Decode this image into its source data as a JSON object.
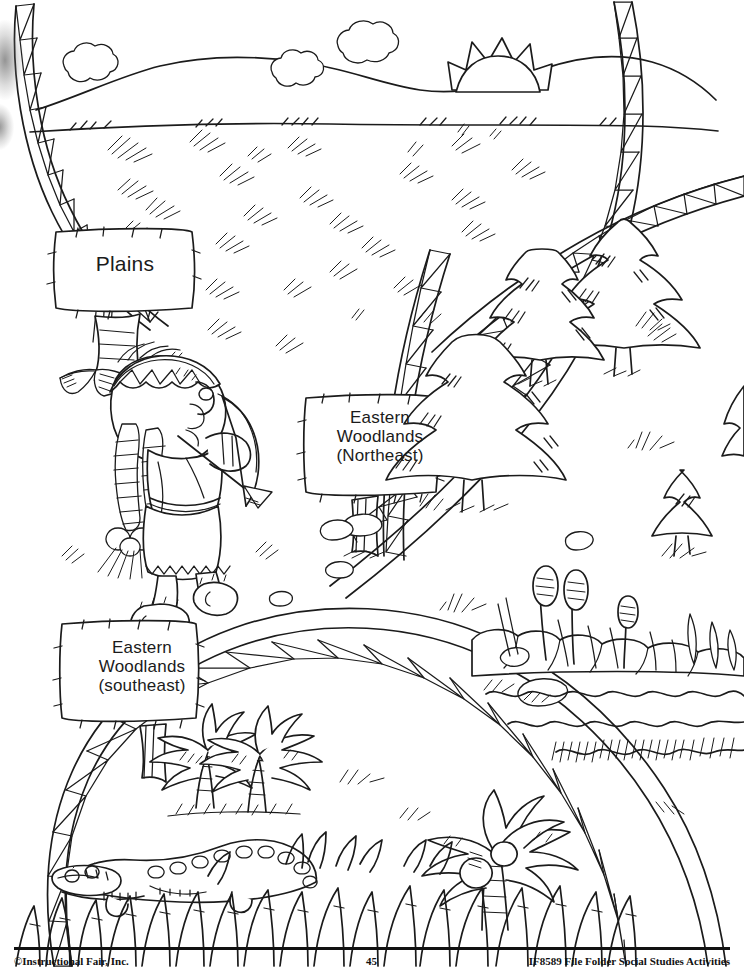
{
  "page": {
    "kind": "coloring-book worksheet page",
    "background_color": "#ffffff",
    "ink_color": "#1b1b1b",
    "width": 744,
    "height": 967
  },
  "regions": [
    {
      "id": "plains",
      "sign_label": "Plains",
      "position": "top",
      "scenery": [
        "clouds",
        "rolling hills",
        "rising sun",
        "prairie grass tufts"
      ]
    },
    {
      "id": "eastern-woodlands-northeast",
      "sign_label": "Eastern\nWoodlands\n(Northeast)",
      "position": "right",
      "scenery": [
        "pine trees",
        "grass clumps",
        "cattails",
        "rocks",
        "lake water"
      ]
    },
    {
      "id": "eastern-woodlands-southeast",
      "sign_label": "Eastern\nWoodlands\n(southeast)",
      "position": "bottom",
      "scenery": [
        "palm trees",
        "coconut palm",
        "alligator",
        "tall swamp grass"
      ]
    }
  ],
  "figures": [
    {
      "id": "native-american-child",
      "description": "Child with braided hair, beaded headband and feather, holding a bow and arrow",
      "region": "plains"
    }
  ],
  "footer": {
    "copyright": "©Instructional Fair, Inc.",
    "page_number": "45",
    "source": "IF8589 File Folder Social Studies Activities"
  }
}
